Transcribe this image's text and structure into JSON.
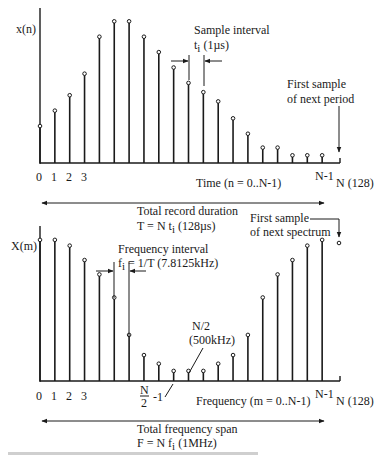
{
  "time_plot": {
    "y_label": "x(n)",
    "x_ticks": [
      "0",
      "1",
      "2",
      "3"
    ],
    "last_tick": "N-1",
    "end_tick": "N (128)",
    "axis_title": "Time (n = 0..N-1)",
    "samples": [
      0.24,
      0.34,
      0.44,
      0.58,
      0.82,
      0.92,
      0.92,
      0.82,
      0.72,
      0.62,
      0.52,
      0.46,
      0.4,
      0.29,
      0.19,
      0.1,
      0.1,
      0.05,
      0.05,
      0.05
    ],
    "sample_interval_label": "Sample interval",
    "sample_interval_value": "t",
    "sample_interval_sub": "i",
    "sample_interval_unit": " (1µs)",
    "next_period_line1": "First sample",
    "next_period_line2": "of next period",
    "record_label": "Total record duration",
    "record_formula_a": "T = N t",
    "record_formula_sub": "i",
    "record_formula_b": " (128µs)"
  },
  "freq_plot": {
    "y_label": "X(m)",
    "x_ticks": [
      "0",
      "1",
      "2",
      "3"
    ],
    "half_tick_num": "N",
    "half_tick_den": "2",
    "half_tick_suffix": "-1",
    "last_tick": "N-1",
    "end_tick": "N (128)",
    "axis_title": "Frequency (m = 0..N-1)",
    "samples": [
      0.98,
      0.98,
      0.94,
      0.84,
      0.74,
      0.58,
      0.32,
      0.18,
      0.12,
      0.07,
      0.07,
      0.07,
      0.12,
      0.18,
      0.32,
      0.58,
      0.74,
      0.84,
      0.94,
      0.98
    ],
    "freq_interval_label": "Frequency interval",
    "freq_interval_a": "f",
    "freq_interval_sub": "i",
    "freq_interval_b": " = 1/T (7.8125kHz)",
    "nyquist_line1": "N/2",
    "nyquist_line2": "(500kHz)",
    "next_spectrum_line1": "First sample",
    "next_spectrum_line2": "of next spectrum",
    "span_label": "Total frequency span",
    "span_formula_a": "F = N f",
    "span_formula_sub": "i",
    "span_formula_b": " (1MHz)"
  }
}
